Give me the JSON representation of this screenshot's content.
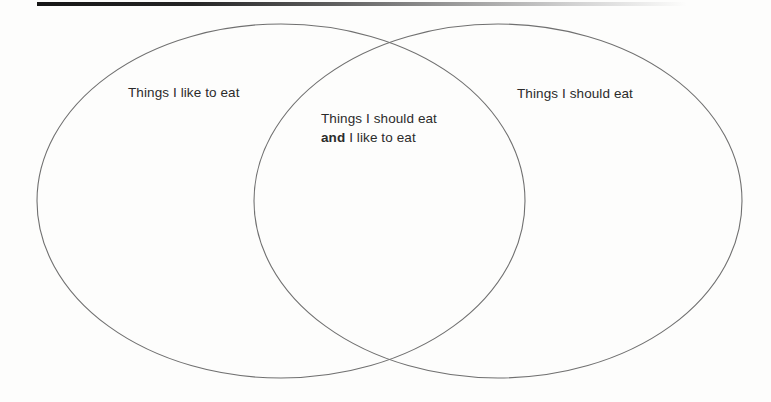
{
  "diagram": {
    "type": "venn",
    "title": "",
    "left_set": {
      "label": "Things I like to eat"
    },
    "right_set": {
      "label": "Things I should eat"
    },
    "intersection": {
      "line1": "Things I should eat",
      "line2_bold": "and",
      "line2_rest": " I like to eat"
    }
  },
  "colors": {
    "ellipse_stroke": "#707070",
    "text": "#2b2b2b",
    "top_rule_start": "#161616",
    "background": "#fdfdfc"
  }
}
